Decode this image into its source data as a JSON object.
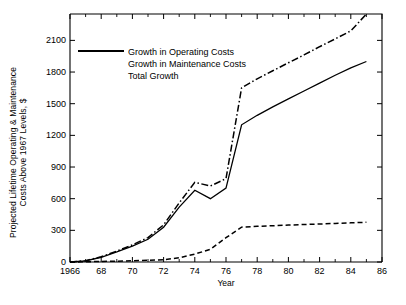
{
  "chart_data": {
    "type": "line",
    "title": "",
    "xlabel": "Year",
    "ylabel_line1": "Projected Lifetime Operating & Maintenance",
    "ylabel_line2": "Costs Above 1967 Levels, $",
    "xlim": [
      1966,
      1986
    ],
    "ylim": [
      0,
      2350
    ],
    "xticks": [
      1966,
      1968,
      1970,
      1972,
      1974,
      1976,
      1978,
      1980,
      1982,
      1984,
      1986
    ],
    "xticklabels": [
      "1966",
      "68",
      "70",
      "72",
      "74",
      "76",
      "78",
      "80",
      "82",
      "84",
      "86"
    ],
    "yticks": [
      0,
      300,
      600,
      900,
      1200,
      1500,
      1800,
      2100
    ],
    "yticklabels": [
      "0",
      "300",
      "600",
      "900",
      "1200",
      "1500",
      "1800",
      "2100"
    ],
    "grid": false,
    "legend_position": "upper-left-inside",
    "line_color": "#000000",
    "background_color": "#ffffff",
    "x": [
      1966,
      1967,
      1968,
      1969,
      1970,
      1971,
      1972,
      1973,
      1974,
      1975,
      1976,
      1977,
      1978,
      1979,
      1980,
      1981,
      1982,
      1983,
      1984,
      1985
    ],
    "series": [
      {
        "name": "Growth in Operating Costs",
        "style": "solid",
        "values": [
          0,
          10,
          45,
          95,
          150,
          215,
          330,
          520,
          680,
          600,
          700,
          1300,
          1390,
          1470,
          1545,
          1620,
          1695,
          1770,
          1840,
          1900
        ]
      },
      {
        "name": "Growth in Maintenance Costs",
        "style": "dashed",
        "values": [
          0,
          2,
          5,
          8,
          12,
          16,
          22,
          40,
          75,
          120,
          230,
          330,
          338,
          344,
          350,
          355,
          360,
          366,
          371,
          376
        ]
      },
      {
        "name": "Total Growth",
        "style": "dashdot",
        "values": [
          0,
          12,
          50,
          103,
          162,
          231,
          352,
          560,
          755,
          720,
          790,
          1650,
          1736,
          1812,
          1888,
          1962,
          2040,
          2114,
          2190,
          2350
        ]
      }
    ]
  },
  "legend": {
    "items": [
      {
        "label": "Growth in Operating Costs",
        "style": "solid"
      },
      {
        "label": "Growth in Maintenance Costs",
        "style": "dashed"
      },
      {
        "label": "Total Growth",
        "style": "dashdot"
      }
    ]
  }
}
